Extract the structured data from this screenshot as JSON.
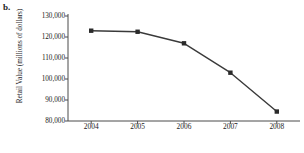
{
  "figure": {
    "panel_label": "b."
  },
  "chart_data": {
    "type": "line",
    "title": "",
    "subtitle": "",
    "xlabel": "Year",
    "ylabel": "Retail Value (millions of dollars)",
    "categories": [
      "2004",
      "2005",
      "2006",
      "2007",
      "2008"
    ],
    "x": [
      2004,
      2005,
      2006,
      2007,
      2008
    ],
    "values": [
      123000,
      122500,
      117000,
      103000,
      84500
    ],
    "series": [
      {
        "name": "Retail Value",
        "values": [
          123000,
          122500,
          117000,
          103000,
          84500
        ]
      }
    ],
    "ylim": [
      80000,
      130000
    ],
    "yticks": [
      80000,
      90000,
      100000,
      110000,
      120000,
      130000
    ],
    "ytick_labels": [
      "80,000",
      "90,000",
      "100,000",
      "110,000",
      "120,000",
      "130,000"
    ],
    "xtick_labels": [
      "2004",
      "2005",
      "2006",
      "2007",
      "2008"
    ],
    "grid": false,
    "legend": "none",
    "marker": "square",
    "line_color": "#3a3a3a",
    "marker_color": "#2b2b2b",
    "axis_color": "#4a4a4a",
    "background": "#ffffff"
  }
}
